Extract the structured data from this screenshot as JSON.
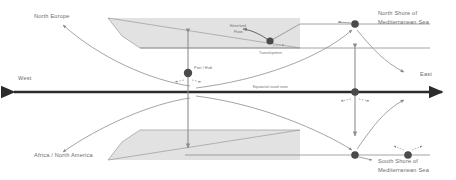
{
  "diagram": {
    "colors": {
      "landmass_fill": "#e2e2e2",
      "landmass_stroke": "#9a9a9a",
      "axis": "#2b2b2b",
      "flow_line": "#8d8d8d",
      "node": "#4a4a4a",
      "text": "#6b6b6b",
      "background": "#ffffff"
    },
    "labels": {
      "north_europe": "North Europe",
      "north_shore_line1": "North Shore of",
      "north_shore_line2": "Mediterranean Sea",
      "south_shore_line1": "South Shore of",
      "south_shore_line2": "Mediterranean Sea",
      "africa_north_america": "Africa / North America",
      "west": "West",
      "east": "East",
      "port_hub": "Port / Hub",
      "hinterland_line1": "Hinterland",
      "hinterland_line2": "Flows",
      "transshipment": "Transshipment",
      "main_route": "Equatorial round route"
    },
    "nodes": [
      {
        "id": "port-hub-center",
        "label": "Port / Hub",
        "x": 188,
        "y": 73
      },
      {
        "id": "node-north-west",
        "label": "",
        "x": 270,
        "y": 41
      },
      {
        "id": "node-north-east",
        "label": "",
        "x": 355,
        "y": 24
      },
      {
        "id": "node-axis-east",
        "label": "",
        "x": 355,
        "y": 92
      },
      {
        "id": "node-south-west",
        "label": "",
        "x": 355,
        "y": 155
      },
      {
        "id": "node-south-east",
        "label": "",
        "x": 408,
        "y": 155
      },
      {
        "id": "node-axis-center",
        "label": "",
        "x": 188,
        "y": 92
      }
    ],
    "axes": {
      "horizontal_label_left": "West",
      "horizontal_label_right": "East",
      "horizontal_y": 92
    }
  }
}
